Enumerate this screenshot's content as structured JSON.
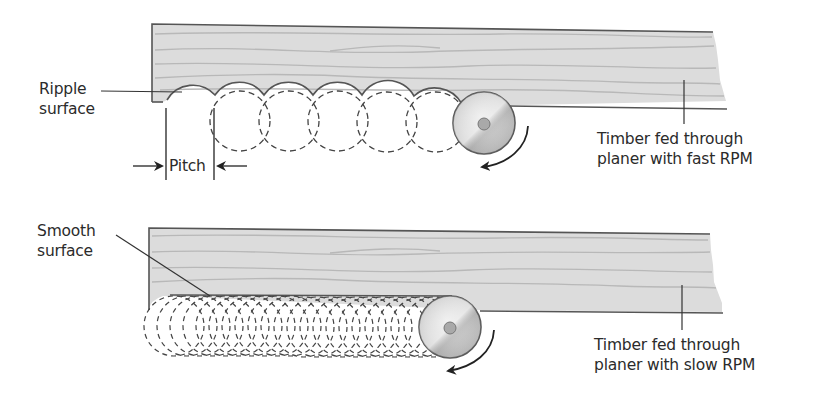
{
  "panels": [
    {
      "id": "fast",
      "surface_label_line1": "Ripple",
      "surface_label_line2": "surface",
      "pitch_label": "Pitch",
      "caption_line1": "Timber fed through",
      "caption_line2": "planer with fast RPM"
    },
    {
      "id": "slow",
      "surface_label_line1": "Smooth",
      "surface_label_line2": "surface",
      "caption_line1": "Timber fed through",
      "caption_line2": "planer with slow RPM"
    }
  ],
  "colors": {
    "timber_fill": "#dcdcdc",
    "timber_edge": "#555555",
    "grain": "#b5b5b5",
    "cutter_fill": "#c8c8c8",
    "line": "#333333"
  },
  "icons": {
    "rotation_arrow": "curved-arrow-counterclockwise",
    "cutter_head": "circular-cutter-disc"
  }
}
